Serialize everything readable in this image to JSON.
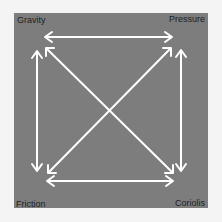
{
  "diagram": {
    "title": "",
    "nodes": [
      {
        "id": "gravity",
        "label": "Gravity",
        "position": "top-left"
      },
      {
        "id": "pressure",
        "label": "Pressure",
        "position": "top-right"
      },
      {
        "id": "friction",
        "label": "Friction",
        "position": "bottom-left"
      },
      {
        "id": "coriolis",
        "label": "Coriolis",
        "position": "bottom-right"
      }
    ],
    "edges": [
      {
        "from": "gravity",
        "to": "pressure",
        "direction": "bidirectional"
      },
      {
        "from": "gravity",
        "to": "friction",
        "direction": "bidirectional"
      },
      {
        "from": "pressure",
        "to": "coriolis",
        "direction": "bidirectional"
      },
      {
        "from": "friction",
        "to": "coriolis",
        "direction": "bidirectional"
      },
      {
        "from": "gravity",
        "to": "coriolis",
        "direction": "bidirectional"
      },
      {
        "from": "pressure",
        "to": "friction",
        "direction": "bidirectional"
      }
    ],
    "colors": {
      "panel": "#7d7d7d",
      "arrow": "#ffffff",
      "label": "#1e1e1e",
      "background": "#f4f4f4"
    }
  }
}
